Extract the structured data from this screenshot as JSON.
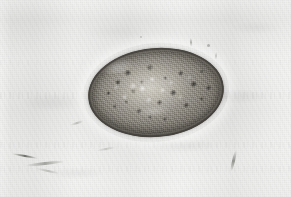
{
  "figure": {
    "domain": "Natural-Image",
    "medium": "light micrograph (brightfield), grayscale, scanned from print",
    "caption": "",
    "width_px": 291,
    "height_px": 197,
    "has_visible_text": false,
    "has_scale_bar": false,
    "has_border_frame": false
  },
  "background": {
    "name": "scanned-paper-field",
    "base_color": "#e8e8e6",
    "light_color": "#f4f4f2",
    "shadow_color": "#d8d8d4",
    "description": "mottled off-white field with fine paper grain, faint vertical scan banding and ghosted print show-through"
  },
  "specimen": {
    "name": "fluke-egg",
    "shape": "broadly ovoid / ellipsoidal",
    "bbox": {
      "x": 88,
      "y": 48,
      "width": 136,
      "height": 89
    },
    "rotation_deg": -5,
    "shell": {
      "name": "egg-shell",
      "color": "#37342f",
      "description": "thin smooth refractile shell, darker at the poles and along the lower rim"
    },
    "interior": {
      "name": "yolk-contents",
      "light_color": "#cfccc4",
      "mid_color": "#b3afa6",
      "dark_color": "#807c74",
      "granule_color": "#232118",
      "description": "densely packed granular yolk cells with numerous dark rounded globules and bright refractile highlights"
    },
    "operculum": {
      "name": "operculum",
      "position": "upper-left pole",
      "description": "faint lighter cap at the upper-left end of the shell"
    }
  },
  "artifacts": [
    {
      "name": "scratch-lower-left-1",
      "x": 12,
      "y": 155,
      "kind": "dark-streak"
    },
    {
      "name": "scratch-lower-left-2",
      "x": 25,
      "y": 162,
      "kind": "dark-streak"
    },
    {
      "name": "scratch-lower-left-3",
      "x": 36,
      "y": 170,
      "kind": "faint-streak"
    },
    {
      "name": "scratch-lower-right",
      "x": 232,
      "y": 150,
      "kind": "dark-diagonal-streak"
    },
    {
      "name": "dust-speck-upper-right-1",
      "x": 190,
      "y": 38,
      "kind": "speck"
    },
    {
      "name": "dust-speck-upper-right-2",
      "x": 215,
      "y": 52,
      "kind": "speck"
    },
    {
      "name": "dust-speck-upper-right-3",
      "x": 207,
      "y": 44,
      "kind": "speck"
    },
    {
      "name": "dust-speck-top-center",
      "x": 140,
      "y": 36,
      "kind": "speck"
    },
    {
      "name": "debris-left-of-egg",
      "x": 70,
      "y": 122,
      "kind": "faint-streak"
    },
    {
      "name": "debris-below-egg",
      "x": 96,
      "y": 148,
      "kind": "faint-streak"
    }
  ],
  "palette": {
    "paper": "#e8e8e6",
    "paper_light": "#f4f4f2",
    "egg_rim": "#37342f",
    "egg_mid": "#9a968e",
    "egg_highlight": "#d9d6ce",
    "granule_dark": "#232118"
  }
}
